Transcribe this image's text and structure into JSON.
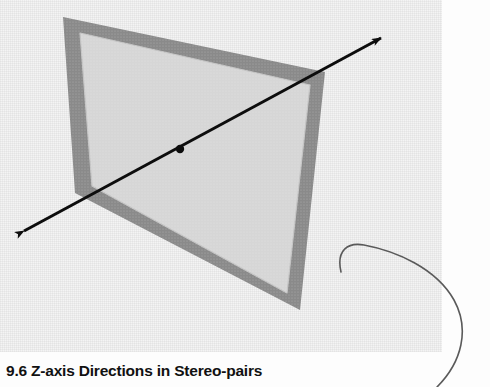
{
  "figure": {
    "background_color": "#fdfdfd",
    "panel_color": "#f4f4f4",
    "frame_border_color": "#8a8a8a",
    "frame_fill_color": "#d6d6d6",
    "arrow_color": "#0d0d0d",
    "leader_color": "#5a5a5a",
    "elements": {
      "plane_frame_name": "image-plane-quadrilateral",
      "axis_arrow_name": "z-axis-double-arrow",
      "center_point_name": "plane-center-point",
      "leader_curve_name": "annotation-leader-curve"
    },
    "plane_outer_corners": [
      [
        63,
        17
      ],
      [
        325,
        72
      ],
      [
        300,
        310
      ],
      [
        75,
        193
      ]
    ],
    "plane_inner_corners": [
      [
        80,
        33
      ],
      [
        310,
        85
      ],
      [
        287,
        293
      ],
      [
        92,
        186
      ]
    ],
    "axis_arrow": {
      "start": [
        12,
        238
      ],
      "end": [
        392,
        32
      ],
      "center_point": [
        180,
        149
      ],
      "double_headed": true
    }
  },
  "caption": {
    "number": "9.6",
    "text": "9.6  Z-axis Directions in Stereo-pairs"
  }
}
